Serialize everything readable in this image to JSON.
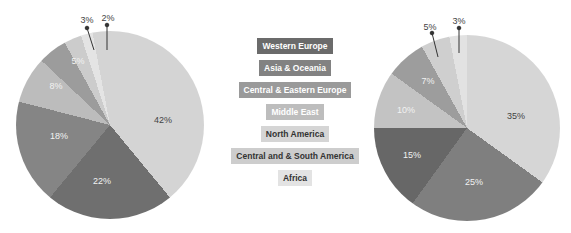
{
  "chart_data": [
    {
      "type": "pie",
      "title": "",
      "start_angle_deg": -18,
      "slices": [
        {
          "category": "Africa",
          "value": 2,
          "label": "2%",
          "color": "#e4e4e4"
        },
        {
          "category": "North America",
          "value": 42,
          "label": "42%",
          "color": "#d4d4d4"
        },
        {
          "category": "Western Europe",
          "value": 22,
          "label": "22%",
          "color": "#6f6f6f"
        },
        {
          "category": "Asia & Oceania",
          "value": 18,
          "label": "18%",
          "color": "#858585"
        },
        {
          "category": "Middle East",
          "value": 8,
          "label": "8%",
          "color": "#bcbcbc"
        },
        {
          "category": "Central & Eastern Europe",
          "value": 5,
          "label": "5%",
          "color": "#9c9c9c"
        },
        {
          "category": "Central and & South America",
          "value": 3,
          "label": "3%",
          "color": "#cccccc"
        }
      ]
    },
    {
      "type": "pie",
      "title": "",
      "start_angle_deg": -11,
      "slices": [
        {
          "category": "Africa",
          "value": 3,
          "label": "3%",
          "color": "#e2e2e2"
        },
        {
          "category": "North America",
          "value": 35,
          "label": "35%",
          "color": "#d6d6d6"
        },
        {
          "category": "Asia & Oceania",
          "value": 25,
          "label": "25%",
          "color": "#7f7f7f"
        },
        {
          "category": "Western Europe",
          "value": 15,
          "label": "15%",
          "color": "#676767"
        },
        {
          "category": "Middle East",
          "value": 10,
          "label": "10%",
          "color": "#c3c3c3"
        },
        {
          "category": "Central & Eastern Europe",
          "value": 7,
          "label": "7%",
          "color": "#9d9d9d"
        },
        {
          "category": "Central and & South America",
          "value": 5,
          "label": "5%",
          "color": "#cfcfcf"
        }
      ]
    }
  ],
  "legend": [
    {
      "label": "Western Europe",
      "bg": "#6b6b6b",
      "fg": "#ffffff"
    },
    {
      "label": "Asia & Oceania",
      "bg": "#828282",
      "fg": "#ffffff"
    },
    {
      "label": "Central & Eastern Europe",
      "bg": "#9a9a9a",
      "fg": "#ffffff"
    },
    {
      "label": "Middle East",
      "bg": "#bdbdbd",
      "fg": "#ffffff"
    },
    {
      "label": "North America",
      "bg": "#d5d5d5",
      "fg": "#333333"
    },
    {
      "label": "Central and & South America",
      "bg": "#cdcdcd",
      "fg": "#333333"
    },
    {
      "label": "Africa",
      "bg": "#e3e3e3",
      "fg": "#333333"
    }
  ],
  "layout": {
    "pies": [
      {
        "cx": 110,
        "cy": 125,
        "r": 94
      },
      {
        "cx": 467,
        "cy": 128,
        "r": 93
      }
    ],
    "labels": [
      [
        {
          "x": 108,
          "y": 18,
          "light": false
        },
        {
          "x": 163,
          "y": 120,
          "light": false
        },
        {
          "x": 102,
          "y": 181,
          "light": true
        },
        {
          "x": 59,
          "y": 136,
          "light": true
        },
        {
          "x": 56,
          "y": 86,
          "light": true
        },
        {
          "x": 78,
          "y": 61,
          "light": true
        },
        {
          "x": 87,
          "y": 20,
          "light": false
        }
      ],
      [
        {
          "x": 459,
          "y": 21,
          "light": false
        },
        {
          "x": 516,
          "y": 116,
          "light": false
        },
        {
          "x": 474,
          "y": 182,
          "light": true
        },
        {
          "x": 412,
          "y": 155,
          "light": true
        },
        {
          "x": 406,
          "y": 110,
          "light": true
        },
        {
          "x": 428,
          "y": 81,
          "light": true
        },
        {
          "x": 430,
          "y": 27,
          "light": false
        }
      ]
    ]
  }
}
